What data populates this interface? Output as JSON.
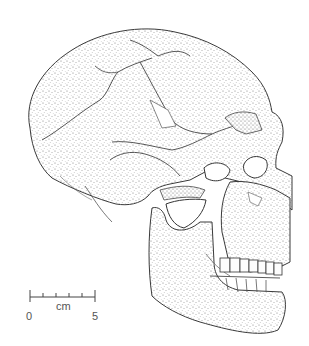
{
  "figure": {
    "colors": {
      "background": "#ffffff",
      "ink": "#3a3a3a",
      "stipple": "#8a8a8a"
    }
  },
  "scale_bar": {
    "unit": "cm",
    "start_label": "0",
    "end_label": "5",
    "ticks": 6
  }
}
